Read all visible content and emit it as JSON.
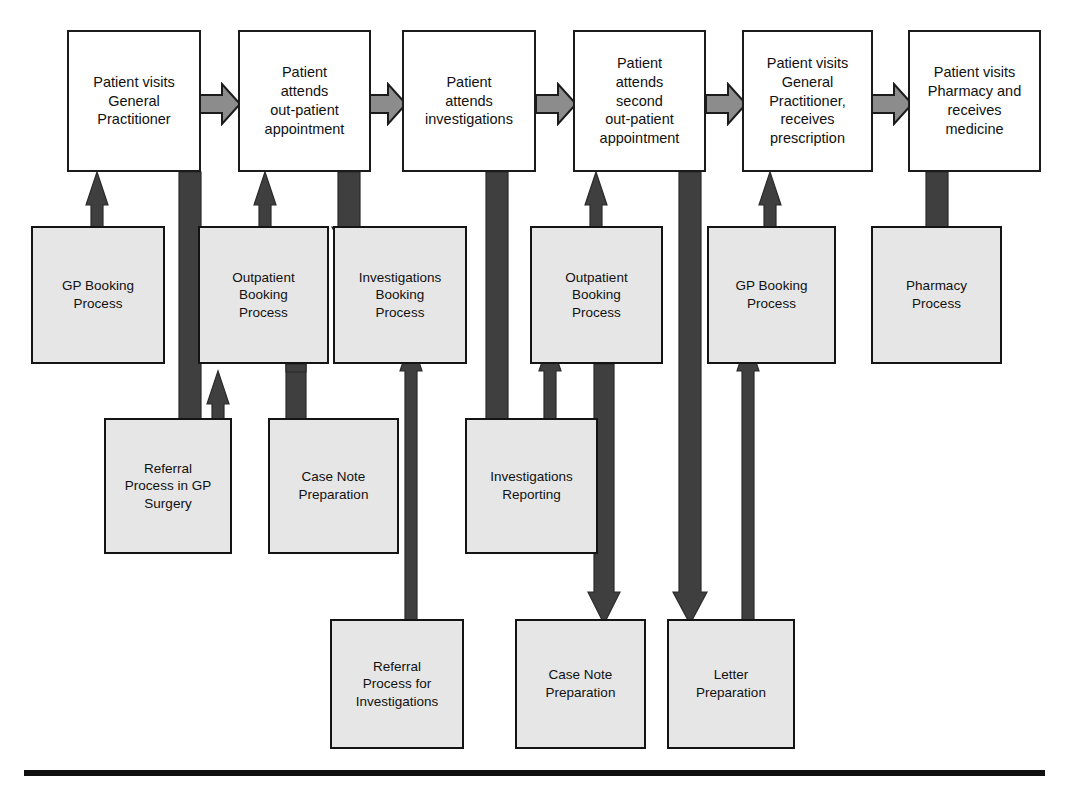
{
  "diagram": {
    "colors": {
      "process_fill": "#ffffff",
      "subprocess_fill": "#e6e6e6",
      "outline": "#1b1b1b",
      "flow_arrow_fill": "#8c8c8c",
      "link_arrow_fill": "#3f3f3f",
      "rule": "#101010"
    },
    "main_flow": [
      {
        "id": "gp-visit",
        "label": "Patient visits\nGeneral\nPractitioner"
      },
      {
        "id": "outpatient-1",
        "label": "Patient\nattends\nout-patient\nappointment"
      },
      {
        "id": "investigations",
        "label": "Patient\nattends\ninvestigations"
      },
      {
        "id": "outpatient-2",
        "label": "Patient\nattends\nsecond\nout-patient\nappointment"
      },
      {
        "id": "gp-prescription",
        "label": "Patient visits\nGeneral\nPractitioner,\nreceives\nprescription"
      },
      {
        "id": "pharmacy",
        "label": "Patient visits\nPharmacy and\nreceives\nmedicine"
      }
    ],
    "support_row_1": [
      {
        "id": "gp-booking-1",
        "label": "GP Booking\nProcess"
      },
      {
        "id": "outpatient-booking-1",
        "label": "Outpatient\nBooking\nProcess"
      },
      {
        "id": "investigations-booking",
        "label": "Investigations\nBooking\nProcess"
      },
      {
        "id": "outpatient-booking-2",
        "label": "Outpatient\nBooking\nProcess"
      },
      {
        "id": "gp-booking-2",
        "label": "GP Booking\nProcess"
      },
      {
        "id": "pharmacy-process",
        "label": "Pharmacy\nProcess"
      }
    ],
    "support_row_2": [
      {
        "id": "referral-gp-surgery",
        "label": "Referral\nProcess in GP\nSurgery"
      },
      {
        "id": "case-note-prep-1",
        "label": "Case Note\nPreparation"
      },
      {
        "id": "investigations-report",
        "label": "Investigations\nReporting"
      }
    ],
    "support_row_3": [
      {
        "id": "referral-investigations",
        "label": "Referral\nProcess for\nInvestigations"
      },
      {
        "id": "case-note-prep-2",
        "label": "Case Note\nPreparation"
      },
      {
        "id": "letter-prep",
        "label": "Letter\nPreparation"
      }
    ]
  }
}
